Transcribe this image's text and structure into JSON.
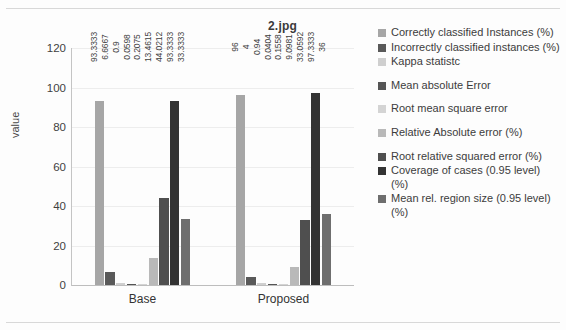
{
  "chart_data": {
    "type": "bar",
    "title": "2.jpg",
    "xlabel": "",
    "ylabel": "value",
    "ylim": [
      0,
      120
    ],
    "yticks": [
      0,
      20,
      40,
      60,
      80,
      100,
      120
    ],
    "grid": true,
    "legend_position": "right",
    "categories": [
      "Base",
      "Proposed"
    ],
    "series": [
      {
        "name": "Correctly classified Instances (%)",
        "color": "#a6a6a6",
        "values": [
          93.3333,
          96
        ],
        "labels": [
          "93.3333",
          "96"
        ]
      },
      {
        "name": "Incorrectly classified instances (%)",
        "color": "#595959",
        "values": [
          6.6667,
          4
        ],
        "labels": [
          "6.6667",
          "4"
        ]
      },
      {
        "name": "Kappa statistc",
        "color": "#cfcfcf",
        "values": [
          0.9,
          0.94
        ],
        "labels": [
          "0.9",
          "0.94"
        ]
      },
      {
        "name": "Mean absolute Error",
        "color": "#555555",
        "values": [
          0.0598,
          0.0404
        ],
        "labels": [
          "0.0598",
          "0.0404"
        ]
      },
      {
        "name": "Root mean square error",
        "color": "#d4d4d4",
        "values": [
          0.2075,
          0.1558
        ],
        "labels": [
          "0.2075",
          "0.1558"
        ]
      },
      {
        "name": "Relative Absolute error (%)",
        "color": "#b9b9b9",
        "values": [
          13.4615,
          9.0981
        ],
        "labels": [
          "13.4615",
          "9.0981"
        ]
      },
      {
        "name": "Root relative squared error (%)",
        "color": "#4f4f4f",
        "values": [
          44.0212,
          33.0592
        ],
        "labels": [
          "44.0212",
          "33.0592"
        ]
      },
      {
        "name": "Coverage of cases (0.95 level) (%)",
        "color": "#333333",
        "values": [
          93.3333,
          97.3333
        ],
        "labels": [
          "93.3333",
          "97.3333"
        ]
      },
      {
        "name": "Mean rel. region size (0.95 level) (%)",
        "color": "#6e6e6e",
        "values": [
          33.3333,
          36
        ],
        "labels": [
          "33.3333",
          "36"
        ]
      }
    ]
  },
  "legend": {
    "items": [
      {
        "label": "Correctly classified Instances (%)",
        "color": "#a6a6a6",
        "gap": false
      },
      {
        "label": "Incorrectly classified instances (%)",
        "color": "#595959",
        "gap": false
      },
      {
        "label": "Kappa statistc",
        "color": "#cfcfcf",
        "gap": false
      },
      {
        "label": "Mean absolute Error",
        "color": "#555555",
        "gap": true
      },
      {
        "label": "Root mean square error",
        "color": "#d4d4d4",
        "gap": true
      },
      {
        "label": "Relative Absolute error (%)",
        "color": "#b9b9b9",
        "gap": true
      },
      {
        "label": "Root relative squared error (%)",
        "color": "#4f4f4f",
        "gap": true
      },
      {
        "label": "Coverage of cases (0.95 level) (%)",
        "color": "#333333",
        "gap": false
      },
      {
        "label": "Mean rel. region size (0.95 level) (%)",
        "color": "#6e6e6e",
        "gap": false
      }
    ]
  }
}
